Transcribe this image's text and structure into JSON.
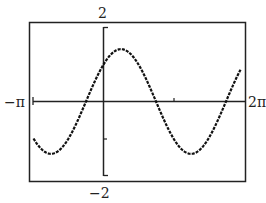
{
  "chart_data": {
    "type": "line",
    "title": "",
    "function": "y = sin x + cos x",
    "xlabel": "",
    "ylabel": "",
    "xlim_labels": {
      "min": "−π",
      "max": "2π"
    },
    "ylim_labels": {
      "max": "2",
      "min": "−2"
    },
    "xlim": [
      -3.14159,
      6.28319
    ],
    "ylim": [
      -2,
      2
    ],
    "x_ticks": [
      -3.14159,
      0,
      3.14159,
      6.28319
    ],
    "y_ticks": [
      -2,
      -1,
      0,
      1,
      2
    ],
    "grid": false,
    "series": [
      {
        "name": "y = sin x + cos x",
        "x": [
          -3.1416,
          -2.3562,
          -1.5708,
          -0.7854,
          0,
          0.7854,
          1.5708,
          2.3562,
          3.1416,
          3.927,
          4.7124,
          5.4978,
          6.2832
        ],
        "values": [
          -1,
          -1.414,
          -1,
          0,
          1,
          1.414,
          1,
          0,
          -1,
          -1.414,
          -1,
          0,
          1
        ]
      }
    ]
  },
  "labels": {
    "y_max": "2",
    "y_min": "−2",
    "x_min": "−π",
    "x_max": "2π"
  },
  "colors": {
    "frame": "#222222",
    "curve": "#111111",
    "background": "#ffffff"
  }
}
